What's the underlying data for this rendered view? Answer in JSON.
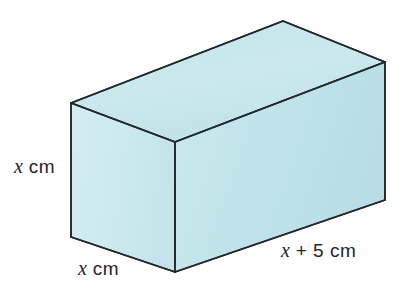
{
  "figure": {
    "name": "rectangular-cuboid-diagram",
    "shape": "cuboid",
    "background_color": "#ffffff",
    "faces": {
      "top_color": "#c7e6ea",
      "left_color": "#cfeaee",
      "front_color": "#bfe2e8",
      "edge_color": "#2a2f33"
    },
    "labels": {
      "height": {
        "var": "x",
        "unit": "cm",
        "full": "x cm",
        "edge": "vertical-left-edge"
      },
      "width": {
        "var": "x",
        "unit": "cm",
        "full": "x cm",
        "edge": "bottom-left-depth-edge"
      },
      "length": {
        "var": "x",
        "op": "+",
        "num": "5",
        "unit": "cm",
        "full": "x + 5 cm",
        "edge": "bottom-right-length-edge"
      }
    },
    "geometry": {
      "front_top_left": [
        71,
        103
      ],
      "front_top_right": [
        175,
        142
      ],
      "front_bottom_left": [
        71,
        237
      ],
      "front_bottom_right": [
        175,
        272
      ],
      "back_top_left": [
        283,
        21
      ],
      "back_top_right": [
        385,
        62
      ],
      "right_bottom": [
        385,
        200
      ]
    }
  }
}
